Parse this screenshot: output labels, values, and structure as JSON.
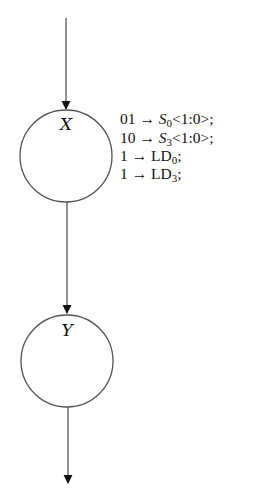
{
  "diagram": {
    "type": "ASM state chart fragment",
    "states": [
      {
        "id": "X",
        "label": "X",
        "cx": 66,
        "cy": 156,
        "r": 46
      },
      {
        "id": "Y",
        "label": "Y",
        "cx": 67,
        "cy": 361,
        "r": 46
      }
    ],
    "edges": [
      {
        "from": "entry",
        "to": "X"
      },
      {
        "from": "X",
        "to": "Y"
      },
      {
        "from": "Y",
        "to": "exit"
      }
    ],
    "state_actions": {
      "X": [
        {
          "value": "01",
          "arrow": "→",
          "target": "S",
          "subscript": "0",
          "suffix": "<1:0>;"
        },
        {
          "value": "10",
          "arrow": "→",
          "target": "S",
          "subscript": "3",
          "suffix": "<1:0>;"
        },
        {
          "value": "1",
          "arrow": "→",
          "target": "LD",
          "subscript": "0",
          "suffix": ";"
        },
        {
          "value": "1",
          "arrow": "→",
          "target": "LD",
          "subscript": "3",
          "suffix": ";"
        }
      ]
    },
    "colors": {
      "stroke": "#555555",
      "text": "#111111",
      "background": "#ffffff"
    }
  }
}
